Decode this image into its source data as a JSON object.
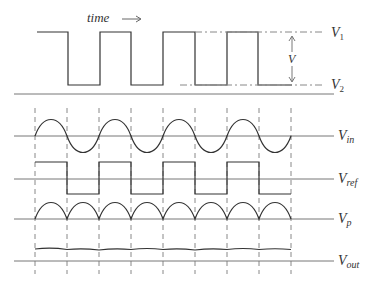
{
  "diagram": {
    "time_label": "time",
    "time_arrow": "→",
    "top_levels": {
      "v1": "V",
      "v1_sub": "1",
      "v2": "V",
      "v2_sub": "2",
      "span": "V"
    },
    "signals": [
      {
        "name": "V",
        "sub": "in"
      },
      {
        "name": "V",
        "sub": "ref"
      },
      {
        "name": "V",
        "sub": "p"
      },
      {
        "name": "V",
        "sub": "out"
      }
    ]
  }
}
